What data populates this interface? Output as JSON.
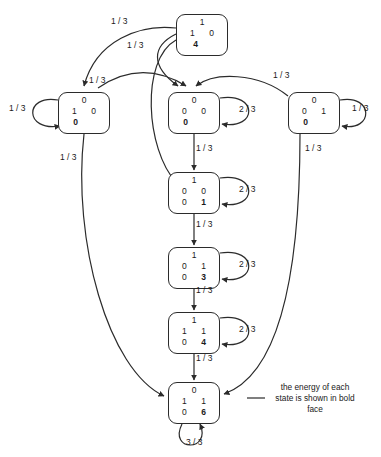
{
  "figure": {
    "caption": "the energy of each\nstate is shown in  bold\nface",
    "stroke_color": "#2b2b2b",
    "background": "#ffffff"
  },
  "states": [
    {
      "id": "s-top",
      "row1": "1",
      "row2_left": "1",
      "row2_right": "0",
      "row3_left": "",
      "row3_right": "",
      "energy": "4",
      "energy_position": "center",
      "x": 176,
      "y": 14
    },
    {
      "id": "s-left",
      "row1": "0",
      "row2_left": "1",
      "row2_right": "0",
      "row3_left": "",
      "row3_right": "",
      "energy": "0",
      "energy_position": "left",
      "x": 58,
      "y": 92
    },
    {
      "id": "s-c1",
      "row1": "0",
      "row2_left": "0",
      "row2_right": "0",
      "row3_left": "",
      "row3_right": "",
      "energy": "0",
      "energy_position": "left",
      "x": 168,
      "y": 92
    },
    {
      "id": "s-right",
      "row1": "0",
      "row2_left": "0",
      "row2_right": "1",
      "row3_left": "",
      "row3_right": "",
      "energy": "0",
      "energy_position": "left",
      "x": 288,
      "y": 92
    },
    {
      "id": "s-c2",
      "row1": "1",
      "row2_left": "0",
      "row2_right": "0",
      "row3_left": "0",
      "row3_right": "1",
      "energy": "1",
      "energy_position": "pair",
      "x": 168,
      "y": 172
    },
    {
      "id": "s-c3",
      "row1": "1",
      "row2_left": "0",
      "row2_right": "1",
      "row3_left": "0",
      "row3_right": "3",
      "energy": "3",
      "energy_position": "pair",
      "x": 168,
      "y": 247
    },
    {
      "id": "s-c4",
      "row1": "1",
      "row2_left": "1",
      "row2_right": "1",
      "row3_left": "0",
      "row3_right": "4",
      "energy": "4",
      "energy_position": "pair",
      "x": 168,
      "y": 312
    },
    {
      "id": "s-bottom",
      "row1": "0",
      "row2_left": "1",
      "row2_right": "1",
      "row3_left": "0",
      "row3_right": "6",
      "energy": "6",
      "energy_position": "pair",
      "x": 168,
      "y": 382
    }
  ],
  "edge_labels": [
    {
      "id": "lbl-top-a",
      "text": "1 / 3",
      "x": 111,
      "y": 16
    },
    {
      "id": "lbl-top-b",
      "text": "1 / 3",
      "x": 127,
      "y": 40
    },
    {
      "id": "lbl-top-c",
      "text": "1 / 3",
      "x": 89,
      "y": 75
    },
    {
      "id": "lbl-right-top",
      "text": "1 / 3",
      "x": 273,
      "y": 70
    },
    {
      "id": "lbl-left-loop",
      "text": "1 / 3",
      "x": 9,
      "y": 103
    },
    {
      "id": "lbl-right-loop",
      "text": "1 / 3",
      "x": 352,
      "y": 103
    },
    {
      "id": "lbl-left-down",
      "text": "1 / 3",
      "x": 60,
      "y": 152
    },
    {
      "id": "lbl-right-down",
      "text": "1 / 3",
      "x": 305,
      "y": 143
    },
    {
      "id": "lbl-c1-c2",
      "text": "1 / 3",
      "x": 196,
      "y": 143
    },
    {
      "id": "lbl-c2-c3",
      "text": "1 / 3",
      "x": 196,
      "y": 219
    },
    {
      "id": "lbl-c3-c4",
      "text": "1 / 3",
      "x": 196,
      "y": 285
    },
    {
      "id": "lbl-c4-bottom",
      "text": "1 / 3",
      "x": 196,
      "y": 353
    },
    {
      "id": "lbl-loop-c1",
      "text": "2 / 3",
      "x": 239,
      "y": 104
    },
    {
      "id": "lbl-loop-c2",
      "text": "2 / 3",
      "x": 239,
      "y": 184
    },
    {
      "id": "lbl-loop-c3",
      "text": "2 / 3",
      "x": 239,
      "y": 259
    },
    {
      "id": "lbl-loop-c4",
      "text": "2 / 3",
      "x": 239,
      "y": 324
    },
    {
      "id": "lbl-bottom-loop",
      "text": "3 / 3",
      "x": 186,
      "y": 437
    }
  ]
}
